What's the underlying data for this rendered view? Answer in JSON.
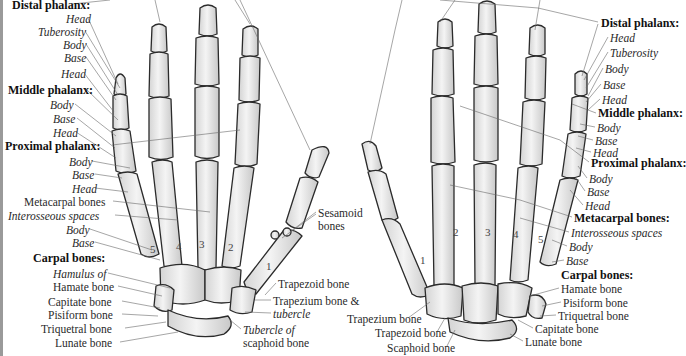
{
  "figure": {
    "left_hand": {
      "view": "palmar",
      "labels": [
        {
          "id": "distal-phalanx-heading",
          "text": "Distal phalanx:",
          "style": "bold",
          "x": 12,
          "y": -1
        },
        {
          "id": "distal-head",
          "text": "Head",
          "style": "italic",
          "x": 66,
          "y": 13
        },
        {
          "id": "distal-tuberosity",
          "text": "Tuberosity",
          "style": "italic",
          "x": 38,
          "y": 26
        },
        {
          "id": "distal-body",
          "text": "Body",
          "style": "italic",
          "x": 63,
          "y": 39
        },
        {
          "id": "distal-base",
          "text": "Base",
          "style": "italic",
          "x": 64,
          "y": 52
        },
        {
          "id": "middle-head",
          "text": "Head",
          "style": "italic",
          "x": 61,
          "y": 68
        },
        {
          "id": "middle-phalanx-heading",
          "text": "Middle phalanx:",
          "style": "bold",
          "x": 8,
          "y": 84
        },
        {
          "id": "middle-body",
          "text": "Body",
          "style": "italic",
          "x": 50,
          "y": 99
        },
        {
          "id": "middle-base",
          "text": "Base",
          "style": "italic",
          "x": 53,
          "y": 113
        },
        {
          "id": "proximal-head",
          "text": "Head",
          "style": "italic",
          "x": 53,
          "y": 127
        },
        {
          "id": "proximal-phalanx-heading",
          "text": "Proximal phalanx:",
          "style": "bold",
          "x": 5,
          "y": 140
        },
        {
          "id": "proximal-body",
          "text": "Body",
          "style": "italic",
          "x": 69,
          "y": 156
        },
        {
          "id": "proximal-base",
          "text": "Base",
          "style": "italic",
          "x": 72,
          "y": 169
        },
        {
          "id": "metacarpal-head",
          "text": "Head",
          "style": "italic",
          "x": 72,
          "y": 183
        },
        {
          "id": "metacarpal-bones",
          "text": "Metacarpal bones",
          "style": "regular",
          "x": 24,
          "y": 196
        },
        {
          "id": "interosseous-spaces",
          "text": "Interosseous spaces",
          "style": "italic",
          "x": 8,
          "y": 210
        },
        {
          "id": "metacarpal-body",
          "text": "Body",
          "style": "italic",
          "x": 66,
          "y": 224
        },
        {
          "id": "metacarpal-base",
          "text": "Base",
          "style": "italic",
          "x": 72,
          "y": 237
        },
        {
          "id": "carpal-bones-heading",
          "text": "Carpal bones:",
          "style": "bold",
          "x": 33,
          "y": 252
        },
        {
          "id": "hamulus-of",
          "text": "Hamulus of",
          "style": "italic",
          "x": 53,
          "y": 268
        },
        {
          "id": "hamate-bone",
          "text": "Hamate bone",
          "style": "regular",
          "x": 53,
          "y": 281
        },
        {
          "id": "capitate-bone",
          "text": "Capitate bone",
          "style": "regular",
          "x": 48,
          "y": 296
        },
        {
          "id": "pisiform-bone",
          "text": "Pisiform bone",
          "style": "regular",
          "x": 48,
          "y": 309
        },
        {
          "id": "triquetral-bone",
          "text": "Triquetral bone",
          "style": "regular",
          "x": 41,
          "y": 323
        },
        {
          "id": "lunate-bone",
          "text": "Lunate bone",
          "style": "regular",
          "x": 55,
          "y": 337
        },
        {
          "id": "sesamoid",
          "text": "Sesamoid",
          "style": "regular",
          "x": 318,
          "y": 207
        },
        {
          "id": "sesamoid-bones",
          "text": "bones",
          "style": "regular",
          "x": 318,
          "y": 220
        },
        {
          "id": "trapezoid-bone",
          "text": "Trapezoid bone",
          "style": "regular",
          "x": 278,
          "y": 278
        },
        {
          "id": "trapezium-bone",
          "text": "Trapezium bone &",
          "style": "regular",
          "x": 273,
          "y": 295
        },
        {
          "id": "tubercle",
          "text": "tubercle",
          "style": "italic",
          "x": 273,
          "y": 308
        },
        {
          "id": "tubercle-of",
          "text": "Tubercle of",
          "style": "italic",
          "x": 243,
          "y": 324
        },
        {
          "id": "scaphoid-bone",
          "text": "scaphoid bone",
          "style": "regular",
          "x": 243,
          "y": 337
        }
      ],
      "metacarpal_numbers": [
        {
          "text": "5",
          "x": 150,
          "y": 243
        },
        {
          "text": "4",
          "x": 176,
          "y": 240
        },
        {
          "text": "3",
          "x": 199,
          "y": 238
        },
        {
          "text": "2",
          "x": 228,
          "y": 241
        },
        {
          "text": "1",
          "x": 266,
          "y": 260
        }
      ]
    },
    "right_hand": {
      "view": "dorsal",
      "labels": [
        {
          "id": "distal-phalanx-heading",
          "text": "Distal phalanx:",
          "style": "bold",
          "x": 601,
          "y": 17
        },
        {
          "id": "distal-head",
          "text": "Head",
          "style": "italic",
          "x": 610,
          "y": 32
        },
        {
          "id": "distal-tuberosity",
          "text": "Tuberosity",
          "style": "italic",
          "x": 610,
          "y": 47
        },
        {
          "id": "distal-body",
          "text": "Body",
          "style": "italic",
          "x": 605,
          "y": 63
        },
        {
          "id": "distal-base",
          "text": "Base",
          "style": "italic",
          "x": 603,
          "y": 79
        },
        {
          "id": "middle-head",
          "text": "Head",
          "style": "italic",
          "x": 602,
          "y": 94
        },
        {
          "id": "middle-phalanx-heading",
          "text": "Middle phalanx:",
          "style": "bold",
          "x": 598,
          "y": 107
        },
        {
          "id": "middle-body",
          "text": "Body",
          "style": "italic",
          "x": 597,
          "y": 122
        },
        {
          "id": "middle-base",
          "text": "Base",
          "style": "italic",
          "x": 595,
          "y": 135
        },
        {
          "id": "proximal-head",
          "text": "Head",
          "style": "italic",
          "x": 593,
          "y": 147
        },
        {
          "id": "proximal-phalanx-heading",
          "text": "Proximal phalanx:",
          "style": "bold",
          "x": 591,
          "y": 157
        },
        {
          "id": "proximal-body",
          "text": "Body",
          "style": "italic",
          "x": 589,
          "y": 173
        },
        {
          "id": "proximal-base",
          "text": "Base",
          "style": "italic",
          "x": 587,
          "y": 186
        },
        {
          "id": "metacarpal-head",
          "text": "Head",
          "style": "italic",
          "x": 585,
          "y": 200
        },
        {
          "id": "metacarpal-bones",
          "text": "Metacarpal bones:",
          "style": "bold",
          "x": 574,
          "y": 212
        },
        {
          "id": "interosseous-spaces",
          "text": "Interosseous spaces",
          "style": "italic",
          "x": 571,
          "y": 227
        },
        {
          "id": "metacarpal-body",
          "text": "Body",
          "style": "italic",
          "x": 569,
          "y": 241
        },
        {
          "id": "metacarpal-base",
          "text": "Base",
          "style": "italic",
          "x": 566,
          "y": 255
        },
        {
          "id": "carpal-bones-heading",
          "text": "Carpal bones:",
          "style": "bold",
          "x": 561,
          "y": 269
        },
        {
          "id": "hamate-bone",
          "text": "Hamate bone",
          "style": "regular",
          "x": 561,
          "y": 283
        },
        {
          "id": "pisiform-bone",
          "text": "Pisiform bone",
          "style": "regular",
          "x": 563,
          "y": 297
        },
        {
          "id": "triquetral-bone",
          "text": "Triquetral bone",
          "style": "regular",
          "x": 558,
          "y": 310
        },
        {
          "id": "capitate-bone",
          "text": "Capitate bone",
          "style": "regular",
          "x": 535,
          "y": 323
        },
        {
          "id": "lunate-bone",
          "text": "Lunate bone",
          "style": "regular",
          "x": 525,
          "y": 336
        },
        {
          "id": "trapezium-bone",
          "text": "Trapezium bone",
          "style": "regular",
          "x": 347,
          "y": 313
        },
        {
          "id": "trapezoid-bone",
          "text": "Trapezoid bone",
          "style": "regular",
          "x": 375,
          "y": 327
        },
        {
          "id": "scaphoid-bone",
          "text": "Scaphoid bone",
          "style": "regular",
          "x": 387,
          "y": 342
        }
      ],
      "metacarpal_numbers": [
        {
          "text": "1",
          "x": 420,
          "y": 254
        },
        {
          "text": "2",
          "x": 453,
          "y": 226
        },
        {
          "text": "3",
          "x": 485,
          "y": 226
        },
        {
          "text": "4",
          "x": 513,
          "y": 228
        },
        {
          "text": "5",
          "x": 538,
          "y": 233
        }
      ]
    },
    "colors": {
      "background": "#ffffff",
      "bone_fill": "#ececec",
      "bone_shade": "#c9c9c9",
      "bone_outline": "#2b2b2b",
      "leader_line": "#6a6a6a",
      "text": "#222222",
      "left_edge_bar": "#9a9a9a"
    }
  }
}
